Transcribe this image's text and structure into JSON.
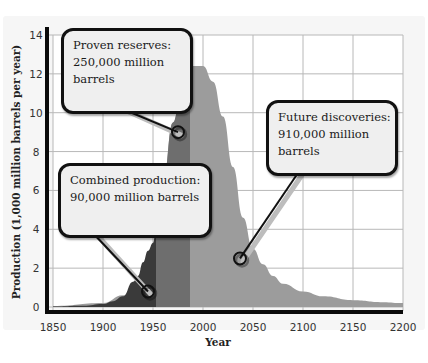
{
  "chart_data": {
    "type": "area",
    "title": "",
    "xlabel": "Year",
    "ylabel": "Production (1,000 million barrels per year)",
    "xlim": [
      1850,
      2200
    ],
    "ylim": [
      0,
      14
    ],
    "x_ticks": [
      "1850",
      "1900",
      "1950",
      "2000",
      "2050",
      "2100",
      "2150",
      "2200"
    ],
    "y_ticks": [
      "0",
      "2",
      "4",
      "6",
      "8",
      "10",
      "12",
      "14"
    ],
    "grid": true,
    "series": [
      {
        "name": "Future discoveries",
        "color": "#9c9c9c",
        "x": [
          1850,
          1900,
          1920,
          1940,
          1950,
          1960,
          1970,
          1980,
          1990,
          2000,
          2010,
          2020,
          2030,
          2040,
          2050,
          2060,
          2070,
          2080,
          2100,
          2120,
          2150,
          2180,
          2200
        ],
        "values": [
          0.05,
          0.2,
          0.6,
          1.6,
          3.2,
          6.5,
          9.5,
          11.6,
          12.4,
          12.4,
          11.6,
          9.8,
          7.2,
          4.6,
          3.0,
          2.2,
          1.6,
          1.2,
          0.8,
          0.55,
          0.35,
          0.25,
          0.2
        ]
      },
      {
        "name": "Proven reserves",
        "color": "#6e6e6e",
        "x": [
          1950,
          1960,
          1970,
          1978,
          1987
        ],
        "values": [
          3.2,
          6.5,
          9.5,
          11.0,
          12.2
        ]
      },
      {
        "name": "Combined production",
        "color": "#3a3a3a",
        "x": [
          1850,
          1880,
          1900,
          1910,
          1920,
          1930,
          1935,
          1940,
          1945,
          1950,
          1953
        ],
        "values": [
          0.02,
          0.06,
          0.15,
          0.3,
          0.55,
          1.3,
          1.6,
          2.3,
          2.9,
          3.3,
          4.0
        ]
      }
    ],
    "annotations": [
      {
        "text": "Proven reserves: 250,000 million barrels",
        "x": 1975,
        "y": 9.0
      },
      {
        "text": "Combined production: 90,000 million barrels",
        "x": 1945,
        "y": 0.8
      },
      {
        "text": "Future discoveries: 910,000 million barrels",
        "x": 2037,
        "y": 2.5
      }
    ]
  },
  "callouts": {
    "proven": {
      "line1": "Proven reserves:",
      "line2": "250,000 million",
      "line3": "barrels"
    },
    "combined": {
      "line1": "Combined production:",
      "line2": "90,000 million barrels"
    },
    "future": {
      "line1": "Future discoveries:",
      "line2": "910,000 million",
      "line3": "barrels"
    }
  }
}
